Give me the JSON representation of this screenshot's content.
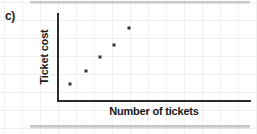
{
  "figure": {
    "part_label": "c)",
    "background_color": "#ffffff",
    "axis_color": "#2b2b2b",
    "point_color": "#333333",
    "grid_color": "#f0f0f0",
    "band_color": "#c9c9c9"
  },
  "chart_data": {
    "type": "scatter",
    "title": "",
    "xlabel": "Number of tickets",
    "ylabel": "Ticket cost",
    "grid": true,
    "legend": "none",
    "xlim": [
      0,
      10
    ],
    "ylim": [
      0,
      10
    ],
    "x": [
      1,
      2,
      3,
      4,
      5
    ],
    "y": [
      1,
      2.4,
      4,
      5.4,
      7.3
    ],
    "points": [
      {
        "x": 1,
        "y": 1,
        "px": 70,
        "py": 84
      },
      {
        "x": 2,
        "y": 2.4,
        "px": 86,
        "py": 71
      },
      {
        "x": 3,
        "y": 4,
        "px": 100,
        "py": 57
      },
      {
        "x": 4,
        "y": 5.4,
        "px": 114,
        "py": 45
      },
      {
        "x": 5,
        "y": 7.3,
        "px": 129,
        "py": 28
      }
    ],
    "xticklabels": [],
    "yticklabels": [],
    "annotations": []
  }
}
